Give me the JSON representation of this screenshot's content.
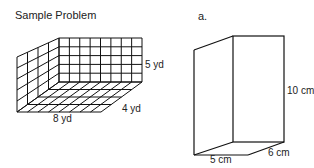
{
  "left_panel": {
    "title": "Sample Problem",
    "grid": {
      "length_cols": 8,
      "height_rows": 5,
      "depth_rows": 4
    },
    "labels": {
      "height": "5 yd",
      "depth": "4 yd",
      "length": "8 yd"
    }
  },
  "right_panel": {
    "title": "a.",
    "labels": {
      "height": "10 cm",
      "depth": "6 cm",
      "width": "5 cm"
    }
  }
}
